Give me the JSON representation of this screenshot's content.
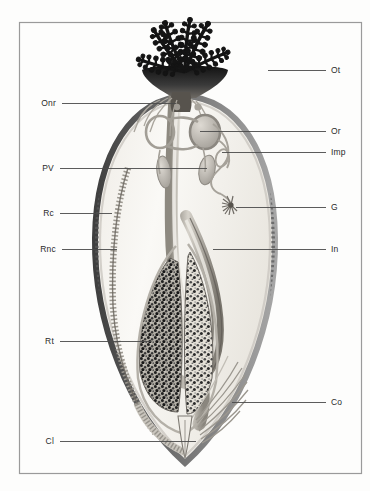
{
  "figure": {
    "background_color": "#fdfdfc",
    "frame": {
      "name": "figure-border",
      "x": 19,
      "y": 22,
      "width": 343,
      "height": 452,
      "stroke_color": "#9a9a9a"
    },
    "palette": {
      "tentacle_dark": "#161616",
      "body_wall": "#6f6f6f",
      "body_wall_dark": "#4c4c4c",
      "interior_light": "#f4f2ee",
      "organ_gray": "#b9b5ae",
      "organ_mid": "#8e8a84",
      "gonad_speckle_dark": "#2b2b2b",
      "gonad_speckle_light": "#ddd9d2",
      "leader_line": "#4a4a4a",
      "label_text": "#2a2a2a"
    }
  },
  "labels_left": [
    {
      "id": "onr",
      "text": "Onr",
      "name": "label-onr",
      "description": "obturacular nerve ring",
      "text_x": 56,
      "text_y": 103,
      "line_x1": 62,
      "line_x2": 176,
      "line_y": 103
    },
    {
      "id": "pv",
      "text": "PV",
      "name": "label-pv",
      "description": "pericardial vesicle",
      "text_x": 54,
      "text_y": 168,
      "line_x1": 60,
      "line_x2": 207,
      "line_y": 168
    },
    {
      "id": "rc",
      "text": "Rc",
      "name": "label-rc",
      "description": "trunk coelom / body wall",
      "text_x": 54,
      "text_y": 213,
      "line_x1": 60,
      "line_x2": 112,
      "line_y": 213
    },
    {
      "id": "rnc",
      "text": "Rnc",
      "name": "label-rnc",
      "description": "trunk nerve cord",
      "text_x": 56,
      "text_y": 249,
      "line_x1": 62,
      "line_x2": 117,
      "line_y": 249
    },
    {
      "id": "rt",
      "text": "Rt",
      "name": "label-rt",
      "description": "trophosome tissue",
      "text_x": 54,
      "text_y": 341,
      "line_x1": 60,
      "line_x2": 151,
      "line_y": 341
    },
    {
      "id": "cl",
      "text": "Cl",
      "name": "label-cl",
      "description": "cloaca / posterior opisthosome tip",
      "text_x": 54,
      "text_y": 441,
      "line_x1": 60,
      "line_x2": 196,
      "line_y": 441
    }
  ],
  "labels_right": [
    {
      "id": "ot",
      "text": "Ot",
      "name": "label-ot",
      "description": "obturacular tentacles (branchial plume)",
      "text_x": 331,
      "text_y": 70,
      "line_x1": 268,
      "line_x2": 326,
      "line_y": 70
    },
    {
      "id": "or",
      "text": "Or",
      "name": "label-or",
      "description": "obturacular ring vessel",
      "text_x": 331,
      "text_y": 131,
      "line_x1": 200,
      "line_x2": 326,
      "line_y": 131
    },
    {
      "id": "imp",
      "text": "Imp",
      "name": "label-imp",
      "description": "intestinal mesenteric plexus",
      "text_x": 331,
      "text_y": 152,
      "line_x1": 222,
      "line_x2": 326,
      "line_y": 152
    },
    {
      "id": "g",
      "text": "G",
      "name": "label-g",
      "description": "gland / gonopore tuft",
      "text_x": 331,
      "text_y": 207,
      "line_x1": 236,
      "line_x2": 326,
      "line_y": 207
    },
    {
      "id": "in",
      "text": "In",
      "name": "label-in",
      "description": "intestine",
      "text_x": 331,
      "text_y": 249,
      "line_x1": 213,
      "line_x2": 326,
      "line_y": 249
    },
    {
      "id": "co",
      "text": "Co",
      "name": "label-co",
      "description": "coelomic / chaetal root fibres",
      "text_x": 331,
      "text_y": 402,
      "line_x1": 232,
      "line_x2": 326,
      "line_y": 402
    }
  ],
  "structures": [
    {
      "id": "tentacle-crown",
      "name": "tentacle-crown",
      "label_ref": "Ot",
      "tentacle_count": 6
    },
    {
      "id": "obturaculum",
      "name": "obturaculum-base",
      "label_ref": "Ot"
    },
    {
      "id": "nerve-ring",
      "name": "nerve-ring",
      "label_ref": "Onr"
    },
    {
      "id": "ring-vessel",
      "name": "ring-vessel",
      "label_ref": "Or"
    },
    {
      "id": "pericardial-vesicle",
      "name": "pericardial-vesicle",
      "label_ref": "PV"
    },
    {
      "id": "mesenteric-plexus",
      "name": "mesenteric-plexus",
      "label_ref": "Imp"
    },
    {
      "id": "gland-tuft",
      "name": "gland-tuft",
      "label_ref": "G"
    },
    {
      "id": "body-wall",
      "name": "body-wall",
      "label_ref": "Rc"
    },
    {
      "id": "nerve-cord",
      "name": "nerve-cord-ladder",
      "label_ref": "Rnc"
    },
    {
      "id": "trophosome-left",
      "name": "trophosome-mass-left",
      "label_ref": "Rt"
    },
    {
      "id": "trophosome-right",
      "name": "trophosome-mass-right",
      "label_ref": "Rt"
    },
    {
      "id": "intestine",
      "name": "intestine-tube",
      "label_ref": "In"
    },
    {
      "id": "chaetal-fibres",
      "name": "chaetal-root-fibres",
      "label_ref": "Co"
    },
    {
      "id": "cloaca",
      "name": "cloaca-tip",
      "label_ref": "Cl"
    }
  ]
}
